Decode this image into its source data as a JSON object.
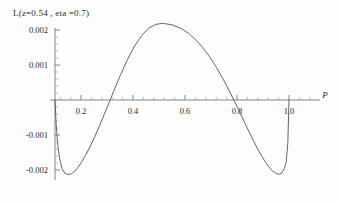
{
  "chart_data": {
    "type": "line",
    "title": "L(z=0.54 , eta =0.7)",
    "xlabel": "P",
    "ylabel": "",
    "xlim": [
      0.0,
      1.06
    ],
    "ylim": [
      -0.0024,
      0.0024
    ],
    "grid": false,
    "legend": null,
    "xticks": [
      0.2,
      0.4,
      0.6,
      0.8,
      1.0
    ],
    "xtick_labels": [
      "0.2",
      "0.4",
      "0.6",
      "0.8",
      "1.0"
    ],
    "yticks": [
      0.002,
      0.001,
      -0.001,
      -0.002
    ],
    "ytick_labels": [
      "0.002",
      "0.001",
      "-0.001",
      "-0.002"
    ],
    "minor_ticks": true,
    "line_color": "#555555",
    "series": [
      {
        "name": "L(P)",
        "x": [
          0.0,
          0.005,
          0.012,
          0.02,
          0.03,
          0.042,
          0.055,
          0.07,
          0.085,
          0.1,
          0.115,
          0.13,
          0.15,
          0.17,
          0.19,
          0.21,
          0.23,
          0.25,
          0.28,
          0.31,
          0.34,
          0.37,
          0.4,
          0.43,
          0.46,
          0.5,
          0.54,
          0.57,
          0.6,
          0.63,
          0.66,
          0.69,
          0.72,
          0.75,
          0.77,
          0.79,
          0.81,
          0.83,
          0.85,
          0.87,
          0.885,
          0.9,
          0.915,
          0.93,
          0.945,
          0.958,
          0.97,
          0.98,
          0.988,
          0.995,
          1.0
        ],
        "y": [
          0.0,
          -0.0007,
          -0.0013,
          -0.00168,
          -0.00196,
          -0.00209,
          -0.00213,
          -0.00211,
          -0.00203,
          -0.00191,
          -0.00176,
          -0.00159,
          -0.00133,
          -0.00105,
          -0.00074,
          -0.00042,
          -9e-05,
          0.00024,
          0.00072,
          0.00116,
          0.00154,
          0.00184,
          0.00205,
          0.00216,
          0.00219,
          0.00215,
          0.00204,
          0.00191,
          0.00173,
          0.00151,
          0.00124,
          0.00093,
          0.00058,
          0.00019,
          -8e-05,
          -0.00036,
          -0.00064,
          -0.00092,
          -0.00119,
          -0.00145,
          -0.00162,
          -0.00178,
          -0.00192,
          -0.00203,
          -0.0021,
          -0.00212,
          -0.00208,
          -0.00196,
          -0.00178,
          -0.00122,
          0.0
        ]
      }
    ],
    "annotations": {
      "zero_crossings": [
        0.0,
        0.232,
        0.768,
        1.0
      ],
      "minimum_left": {
        "x": 0.062,
        "y": -0.00213
      },
      "maximum": {
        "x": 0.5,
        "y": 0.00218
      },
      "minimum_right": {
        "x": 0.938,
        "y": -0.00212
      }
    }
  }
}
